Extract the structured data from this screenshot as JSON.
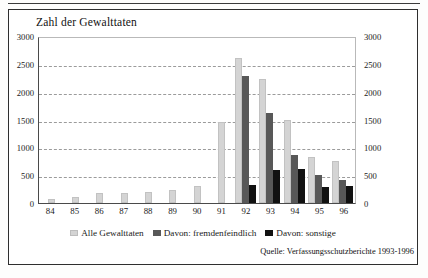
{
  "figure": {
    "title": "Zahl der Gewalttaten",
    "source_note": "Quelle: Verfassungsschutzberichte 1993-1996"
  },
  "chart_data": {
    "type": "bar",
    "title": "Zahl der Gewalttaten",
    "xlabel": "",
    "ylabel": "",
    "ylim": [
      0,
      3000
    ],
    "ytick_step": 500,
    "yticks": [
      0,
      500,
      1000,
      1500,
      2000,
      2500,
      3000
    ],
    "ytick_labels": [
      "0",
      "500",
      "1000",
      "1500",
      "2000",
      "2500",
      "3000"
    ],
    "dual_y_axis": true,
    "grid": "horizontal-dashed",
    "legend_position": "bottom-center",
    "categories": [
      "84",
      "85",
      "86",
      "87",
      "88",
      "89",
      "90",
      "91",
      "92",
      "93",
      "94",
      "95",
      "96"
    ],
    "series": [
      {
        "name": "Alle Gewalttaten",
        "color": "#d4d4d4",
        "values": [
          75,
          110,
          185,
          180,
          190,
          230,
          300,
          1450,
          2610,
          2230,
          1500,
          830,
          760
        ]
      },
      {
        "name": "Davon: fremdenfeindlich",
        "color": "#585858",
        "values": [
          0,
          0,
          0,
          0,
          0,
          0,
          0,
          0,
          2280,
          1610,
          860,
          500,
          420
        ]
      },
      {
        "name": "Davon: sonstige",
        "color": "#111111",
        "values": [
          0,
          0,
          0,
          0,
          0,
          0,
          0,
          0,
          330,
          600,
          620,
          290,
          310
        ]
      }
    ],
    "annotations": [
      "Quelle: Verfassungsschutzberichte 1993-1996"
    ]
  }
}
